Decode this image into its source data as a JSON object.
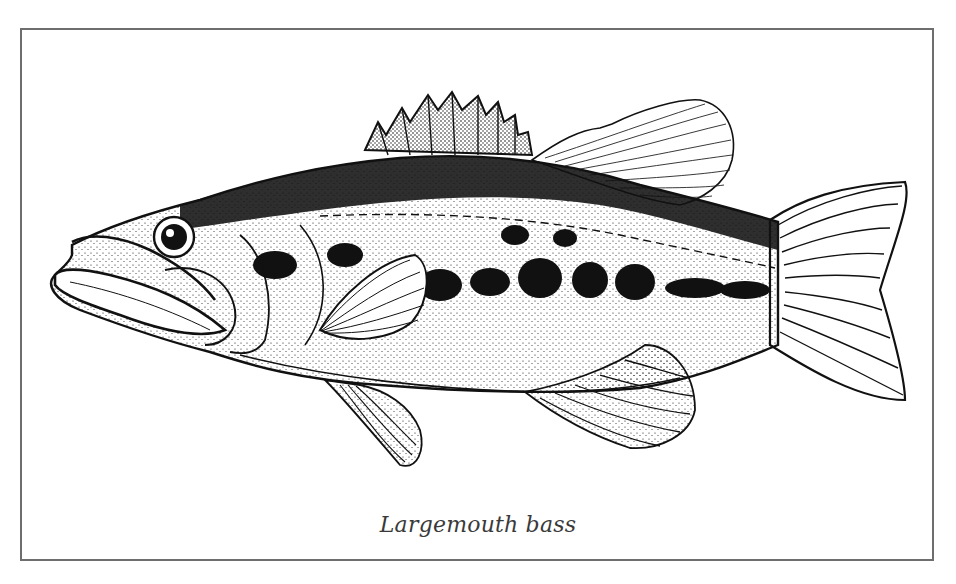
{
  "figure": {
    "caption": "Largemouth bass",
    "colors": {
      "ink": "#111111",
      "frame": "#6e6e6e",
      "background": "#ffffff",
      "caption": "#3a3a3a"
    }
  }
}
